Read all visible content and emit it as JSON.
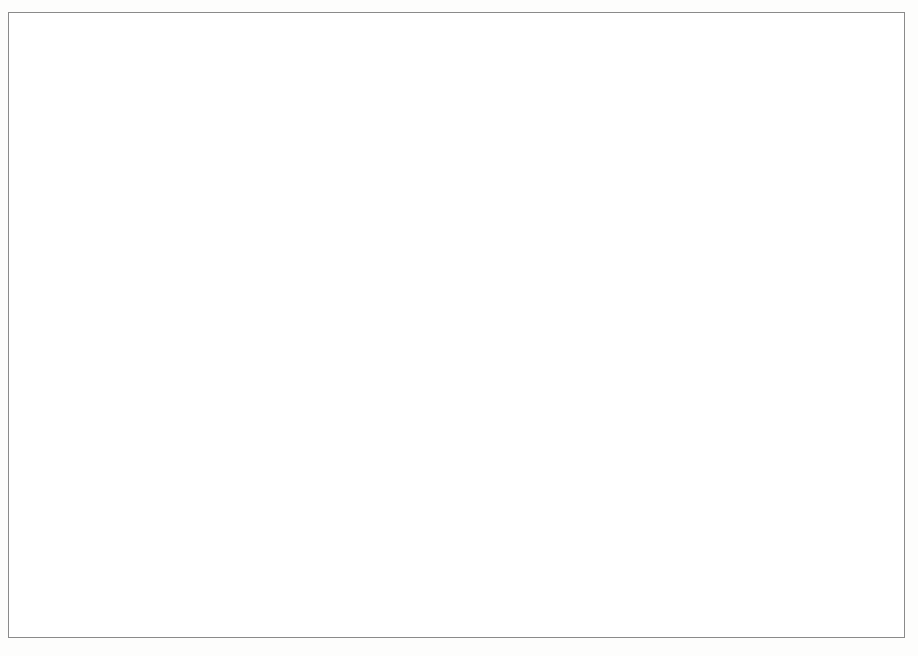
{
  "chart_data": {
    "type": "line",
    "title": "",
    "xlabel": "",
    "ylabel": "US$ milhões",
    "ylim": [
      0,
      220000
    ],
    "yticks": [
      0,
      40000,
      80000,
      120000,
      160000,
      200000
    ],
    "ytick_labels": [
      "0",
      "40.000",
      "80.000",
      "120.000",
      "160.000",
      "200.000"
    ],
    "grid": true,
    "legend_position": "bottom",
    "x_tick_labels": [
      "1995 T4",
      "1996 T2",
      "1996 T4",
      "1997 T2",
      "1997 T4",
      "1998 T2",
      "1998 T4",
      "1999 T2",
      "1999 T4",
      "2000 T2",
      "2000 T4",
      "2001 T2",
      "2001 T4",
      "2002 T2",
      "2002 T4",
      "2003 T2",
      "2003 T4",
      "2004 T2",
      "2004 T4",
      "2005 T2",
      "2005 T4",
      "2006 T2",
      "2006 T4",
      "2007 T2",
      "2007 T4",
      "2008 T2",
      "2008 T4"
    ],
    "x": [
      "1995 T4",
      "1996 T1",
      "1996 T2",
      "1996 T3",
      "1996 T4",
      "1997 T1",
      "1997 T2",
      "1997 T3",
      "1997 T4",
      "1998 T1",
      "1998 T2",
      "1998 T3",
      "1998 T4",
      "1999 T1",
      "1999 T2",
      "1999 T3",
      "1999 T4",
      "2000 T1",
      "2000 T2",
      "2000 T3",
      "2000 T4",
      "2001 T1",
      "2001 T2",
      "2001 T3",
      "2001 T4",
      "2002 T1",
      "2002 T2",
      "2002 T3",
      "2002 T4",
      "2003 T1",
      "2003 T2",
      "2003 T3",
      "2003 T4",
      "2004 T1",
      "2004 T2",
      "2004 T3",
      "2004 T4",
      "2005 T1",
      "2005 T2",
      "2005 T3",
      "2005 T4",
      "2006 T1",
      "2006 T2",
      "2006 T3",
      "2006 T4",
      "2007 T1",
      "2007 T2",
      "2007 T3",
      "2007 T4",
      "2008 T1",
      "2008 T2",
      "2008 T3",
      "2008 T4"
    ],
    "series": [
      {
        "name": "Observado",
        "color": "#4d4d4d",
        "marker": "none",
        "values": [
          51000,
          57000,
          60000,
          62000,
          61000,
          60000,
          62000,
          58000,
          67000,
          60000,
          71000,
          68000,
          45000,
          43000,
          44000,
          41000,
          40000,
          41000,
          40000,
          34000,
          31000,
          37000,
          44000,
          42000,
          41000,
          39000,
          44000,
          39000,
          46000,
          46000,
          52000,
          56000,
          54000,
          56000,
          60000,
          57000,
          58000,
          57000,
          60000,
          62000,
          68000,
          80000,
          98000,
          120000,
          147000,
          170000,
          185000,
          198000,
          200000,
          203000,
          208000,
          198000,
          192000
        ]
      },
      {
        "name": "Cenário 1",
        "color": "#7d7d7d",
        "marker": "square-filled",
        "values": [
          7500,
          7800,
          8000,
          8000,
          8200,
          8400,
          8500,
          8600,
          8800,
          9000,
          9200,
          9300,
          5200,
          5500,
          5800,
          5900,
          6000,
          6200,
          6300,
          5000,
          3200,
          7200,
          7500,
          7400,
          7300,
          7200,
          7400,
          7400,
          7600,
          7700,
          7900,
          8100,
          8300,
          8500,
          8900,
          9200,
          9600,
          10000,
          10500,
          11000,
          11500,
          12000,
          12600,
          13200,
          13800,
          14400,
          15000,
          15600,
          16000,
          16200,
          16400,
          10500,
          11500
        ]
      },
      {
        "name": "Cenário 2",
        "color": "#4a4a4a",
        "marker": "triangle-filled",
        "values": [
          11500,
          12000,
          12300,
          12400,
          12600,
          12900,
          13100,
          13200,
          13500,
          13800,
          14200,
          14400,
          9200,
          9500,
          9800,
          9900,
          10000,
          10300,
          10400,
          9000,
          6000,
          11200,
          11600,
          11500,
          11400,
          11300,
          11500,
          11500,
          11800,
          12000,
          12300,
          12600,
          12900,
          13200,
          13800,
          14300,
          14900,
          15500,
          16200,
          16900,
          17600,
          18400,
          19300,
          20200,
          21100,
          22000,
          23000,
          24000,
          25000,
          25600,
          26200,
          17500,
          19500
        ]
      },
      {
        "name": "Cenário 3",
        "color": "#8a8a8a",
        "marker": "square-open",
        "values": [
          25000,
          27500,
          29000,
          28500,
          29500,
          30500,
          31000,
          30500,
          31500,
          32000,
          30500,
          29500,
          18500,
          19500,
          20000,
          19500,
          19000,
          20000,
          20000,
          18500,
          11000,
          19500,
          20500,
          19800,
          19500,
          19200,
          19800,
          19600,
          20200,
          20500,
          21500,
          22500,
          23000,
          24000,
          25500,
          26500,
          28000,
          29500,
          31500,
          33500,
          36000,
          39000,
          41500,
          44000,
          47000,
          50000,
          53000,
          55500,
          57500,
          58000,
          57000,
          36000,
          42000
        ]
      },
      {
        "name": "Cenário 4",
        "color": "#3a3a3a",
        "marker": "circle-filled",
        "values": [
          29000,
          31500,
          33500,
          32500,
          33500,
          34500,
          35000,
          34000,
          34500,
          35000,
          34000,
          33500,
          21000,
          22000,
          22500,
          22000,
          21500,
          22500,
          22500,
          26500,
          13500,
          22000,
          23000,
          22200,
          21800,
          21500,
          22200,
          22000,
          22800,
          23500,
          24500,
          25500,
          26500,
          27500,
          29500,
          31000,
          33000,
          34500,
          36500,
          39000,
          41500,
          44500,
          47000,
          50000,
          53000,
          56500,
          59500,
          62500,
          64500,
          65000,
          63000,
          39000,
          47000
        ]
      }
    ]
  },
  "legend": {
    "items": [
      {
        "label": "Observado"
      },
      {
        "label": "Cenário 1"
      },
      {
        "label": "Cenário 2"
      },
      {
        "label": "Cenário 3"
      },
      {
        "label": "Cenário 4"
      }
    ]
  },
  "colors": {
    "frame": "#8a8a8a",
    "axis": "#6f6f6f",
    "grid": "#6f6f6f",
    "text": "#111111"
  }
}
